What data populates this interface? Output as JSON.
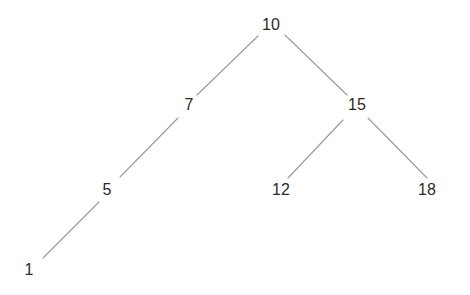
{
  "figure": {
    "kind": "binary-search-tree-diagram",
    "background_color": "#ffffff",
    "edge_color": "#9a9a9a",
    "edge_width": 1.1,
    "label_color": "#2b2b2b",
    "label_font_size_px": 16,
    "width": 470,
    "height": 295
  },
  "tree": {
    "root_value": "10",
    "nodes": [
      {
        "id": "n10",
        "label": "10",
        "x": 271,
        "y": 25,
        "level": 0,
        "side": "root"
      },
      {
        "id": "n7",
        "label": "7",
        "x": 189,
        "y": 105,
        "level": 1,
        "side": "left"
      },
      {
        "id": "n15",
        "label": "15",
        "x": 357,
        "y": 105,
        "level": 1,
        "side": "right"
      },
      {
        "id": "n5",
        "label": "5",
        "x": 107,
        "y": 190,
        "level": 2,
        "side": "left"
      },
      {
        "id": "n12",
        "label": "12",
        "x": 281,
        "y": 190,
        "level": 2,
        "side": "left"
      },
      {
        "id": "n18",
        "label": "18",
        "x": 427,
        "y": 190,
        "level": 2,
        "side": "right"
      },
      {
        "id": "n1",
        "label": "1",
        "x": 29,
        "y": 270,
        "level": 3,
        "side": "left"
      }
    ],
    "edges": [
      {
        "id": "e10-7",
        "from": "n10",
        "to": "n7",
        "from_label": "10",
        "to_label": "7",
        "x1": 258,
        "y1": 36,
        "x2": 197,
        "y2": 95
      },
      {
        "id": "e10-15",
        "from": "n10",
        "to": "n15",
        "from_label": "10",
        "to_label": "15",
        "x1": 285,
        "y1": 35,
        "x2": 347,
        "y2": 95
      },
      {
        "id": "e7-5",
        "from": "n7",
        "to": "n5",
        "from_label": "7",
        "to_label": "5",
        "x1": 178,
        "y1": 118,
        "x2": 120,
        "y2": 177
      },
      {
        "id": "e5-1",
        "from": "n5",
        "to": "n1",
        "from_label": "5",
        "to_label": "1",
        "x1": 99,
        "y1": 202,
        "x2": 43,
        "y2": 258
      },
      {
        "id": "e15-12",
        "from": "n15",
        "to": "n12",
        "from_label": "15",
        "to_label": "12",
        "x1": 343,
        "y1": 120,
        "x2": 288,
        "y2": 178
      },
      {
        "id": "e15-18",
        "from": "n15",
        "to": "n18",
        "from_label": "15",
        "to_label": "18",
        "x1": 368,
        "y1": 118,
        "x2": 427,
        "y2": 178
      }
    ]
  }
}
